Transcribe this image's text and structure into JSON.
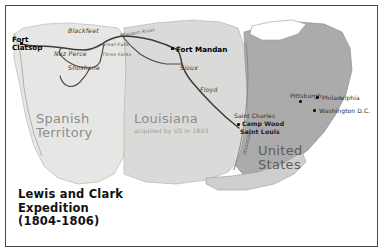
{
  "map": {
    "title_lines": [
      "Lewis and Clark",
      "Expedition",
      "(1804-1806)"
    ],
    "regions": [
      {
        "name": "spanish-territory",
        "label": "Spanish\nTerritory",
        "line1": "Spanish",
        "line2": "Territory",
        "color": "#e4e4e2"
      },
      {
        "name": "louisiana-purchase",
        "line1": "Louisiana",
        "sub": "acquired by US in 1803",
        "color": "#d8d8d6"
      },
      {
        "name": "united-states",
        "line1": "United",
        "line2": "States",
        "color": "#a8a8a8"
      }
    ],
    "forts": [
      {
        "label_1": "Fort",
        "label_2": "Clatsop",
        "x": 12,
        "y": 33
      },
      {
        "label_1": "Fort Mandan",
        "label_2": "",
        "x": 172,
        "y": 44
      }
    ],
    "cities": [
      {
        "name": "saint-charles",
        "label": "Saint Charles",
        "x": 232,
        "y": 112
      },
      {
        "name": "camp-wood",
        "label": "Camp Wood",
        "x": 238,
        "y": 120
      },
      {
        "name": "saint-louis",
        "label": "Saint Louis",
        "x": 236,
        "y": 128
      },
      {
        "name": "pittsburgh",
        "label": "Pittsburgh",
        "x": 285,
        "y": 92
      },
      {
        "name": "philadelphia",
        "label": "Philadelphia",
        "x": 318,
        "y": 95
      },
      {
        "name": "washington-dc",
        "label": "Washington D.C.",
        "x": 315,
        "y": 108
      }
    ],
    "tribes": [
      {
        "name": "blackfeet",
        "label": "Blackfeet",
        "x": 66,
        "y": 26
      },
      {
        "name": "nez-perce",
        "label": "Nez Perce",
        "x": 52,
        "y": 49
      },
      {
        "name": "shoshone",
        "label": "Shoshone",
        "x": 66,
        "y": 62
      },
      {
        "name": "sioux",
        "label": "Sioux",
        "x": 176,
        "y": 62
      },
      {
        "name": "floyd",
        "label": "Floyd",
        "x": 196,
        "y": 84
      }
    ],
    "rivers": [
      {
        "name": "missouri-river",
        "label": "Missouri River",
        "x": 118,
        "y": 28
      },
      {
        "name": "mississippi-river",
        "label": "Mississippi",
        "x": 238,
        "y": 150
      }
    ],
    "route_labels": [
      {
        "name": "route-outbound",
        "label": "Great Falls",
        "x": 100,
        "y": 41
      },
      {
        "name": "route-return",
        "label": "Three Forks",
        "x": 100,
        "y": 50
      }
    ],
    "colors": {
      "spanish": "#e4e4e2",
      "louisiana": "#d9d9d7",
      "united_states": "#a9a9a9",
      "route": "#3d3d3d",
      "frame": "#4a4a4a",
      "background": "#ffffff"
    }
  }
}
